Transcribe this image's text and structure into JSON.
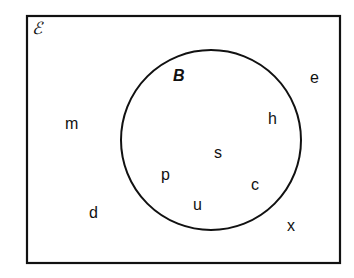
{
  "diagram": {
    "type": "venn",
    "universal_set": {
      "symbol": "ℰ",
      "elements_outside": [
        "m",
        "e",
        "d",
        "x"
      ]
    },
    "sets": [
      {
        "name": "B",
        "elements": [
          "h",
          "s",
          "p",
          "c",
          "u"
        ]
      }
    ],
    "labels": {
      "universal": "ℰ",
      "set_b": "B",
      "m": "m",
      "e": "e",
      "d": "d",
      "x": "x",
      "h": "h",
      "s": "s",
      "p": "p",
      "c": "c",
      "u": "u"
    },
    "colors": {
      "stroke": "#111111",
      "background": "#ffffff"
    }
  }
}
